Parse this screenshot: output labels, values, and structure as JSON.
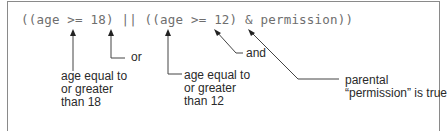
{
  "expression": {
    "text": "((age >= 18) || ((age >= 12) & permission))"
  },
  "annotations": [
    {
      "id": "age-18",
      "target": ">= (first)",
      "text": "age equal to\nor greater\nthan 18"
    },
    {
      "id": "or",
      "target": "||",
      "text": "or"
    },
    {
      "id": "age-12",
      "target": ">= (second)",
      "text": "age equal to\nor greater\nthan 12"
    },
    {
      "id": "and",
      "target": "&",
      "text": "and"
    },
    {
      "id": "permission",
      "target": "permission",
      "text": "parental\n“permission” is true"
    }
  ],
  "colors": {
    "border": "#8a8a8a",
    "code_text": "#6e6e6e",
    "label_text": "#2a2a2a",
    "lines": "#444444"
  }
}
